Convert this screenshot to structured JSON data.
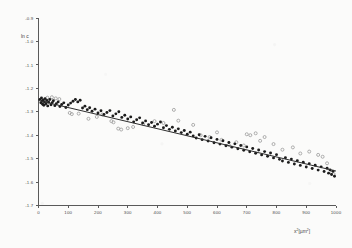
{
  "chart_data": {
    "type": "scatter",
    "title": "",
    "subtitle": "",
    "xlabel": "x² [µm²]",
    "xlabel_base": "x",
    "xlabel_sup": "2",
    "xlabel_unit": "[µm",
    "xlabel_unit_sup": "2",
    "xlabel_unit_close": "]",
    "ylabel": "ln c",
    "xlim": [
      0,
      1000
    ],
    "ylim": [
      -1.7,
      -0.9
    ],
    "grid": false,
    "legend": "none",
    "x_ticks": [
      0,
      100,
      200,
      300,
      400,
      500,
      600,
      700,
      800,
      900,
      1000
    ],
    "x_tick_labels": [
      "0",
      "100",
      "200",
      "300",
      "400",
      "500",
      "600",
      "700",
      "800",
      "900",
      "1000"
    ],
    "y_ticks": [
      -0.9,
      -1.0,
      -1.1,
      -1.2,
      -1.3,
      -1.4,
      -1.5,
      -1.6,
      -1.7
    ],
    "y_tick_labels": [
      "-0.9",
      "-1.0",
      "-1.1",
      "-1.2",
      "-1.3",
      "-1.4",
      "-1.5",
      "-1.6",
      "-1.7"
    ],
    "fit_line": {
      "name": "linear regression fit",
      "x_start": 0,
      "y_start": -1.252,
      "x_end": 1000,
      "y_end": -1.553,
      "slope": -0.000301,
      "intercept": -1.252
    },
    "series": [
      {
        "name": "filled markers",
        "marker": "filled-circle",
        "color": "#1c1c1c",
        "points": [
          [
            5,
            -1.247
          ],
          [
            8,
            -1.262
          ],
          [
            10,
            -1.241
          ],
          [
            12,
            -1.255
          ],
          [
            14,
            -1.268
          ],
          [
            16,
            -1.25
          ],
          [
            18,
            -1.272
          ],
          [
            20,
            -1.258
          ],
          [
            22,
            -1.244
          ],
          [
            25,
            -1.266
          ],
          [
            28,
            -1.252
          ],
          [
            31,
            -1.275
          ],
          [
            34,
            -1.259
          ],
          [
            38,
            -1.248
          ],
          [
            42,
            -1.27
          ],
          [
            46,
            -1.261
          ],
          [
            50,
            -1.253
          ],
          [
            55,
            -1.274
          ],
          [
            60,
            -1.266
          ],
          [
            66,
            -1.258
          ],
          [
            72,
            -1.278
          ],
          [
            78,
            -1.269
          ],
          [
            85,
            -1.262
          ],
          [
            92,
            -1.282
          ],
          [
            100,
            -1.271
          ],
          [
            108,
            -1.263
          ],
          [
            116,
            -1.255
          ],
          [
            124,
            -1.248
          ],
          [
            132,
            -1.258
          ],
          [
            140,
            -1.251
          ],
          [
            148,
            -1.284
          ],
          [
            156,
            -1.276
          ],
          [
            164,
            -1.291
          ],
          [
            172,
            -1.283
          ],
          [
            180,
            -1.298
          ],
          [
            190,
            -1.289
          ],
          [
            200,
            -1.305
          ],
          [
            210,
            -1.296
          ],
          [
            220,
            -1.312
          ],
          [
            230,
            -1.303
          ],
          [
            240,
            -1.295
          ],
          [
            250,
            -1.318
          ],
          [
            260,
            -1.309
          ],
          [
            270,
            -1.3
          ],
          [
            280,
            -1.324
          ],
          [
            290,
            -1.315
          ],
          [
            300,
            -1.331
          ],
          [
            310,
            -1.322
          ],
          [
            320,
            -1.343
          ],
          [
            330,
            -1.334
          ],
          [
            340,
            -1.326
          ],
          [
            350,
            -1.348
          ],
          [
            360,
            -1.339
          ],
          [
            370,
            -1.355
          ],
          [
            380,
            -1.346
          ],
          [
            390,
            -1.362
          ],
          [
            400,
            -1.353
          ],
          [
            410,
            -1.344
          ],
          [
            420,
            -1.368
          ],
          [
            430,
            -1.359
          ],
          [
            440,
            -1.375
          ],
          [
            450,
            -1.366
          ],
          [
            460,
            -1.382
          ],
          [
            470,
            -1.373
          ],
          [
            480,
            -1.389
          ],
          [
            490,
            -1.38
          ],
          [
            500,
            -1.396
          ],
          [
            510,
            -1.387
          ],
          [
            520,
            -1.403
          ],
          [
            530,
            -1.412
          ],
          [
            540,
            -1.398
          ],
          [
            550,
            -1.419
          ],
          [
            560,
            -1.405
          ],
          [
            570,
            -1.425
          ],
          [
            580,
            -1.411
          ],
          [
            590,
            -1.432
          ],
          [
            600,
            -1.418
          ],
          [
            610,
            -1.438
          ],
          [
            620,
            -1.424
          ],
          [
            630,
            -1.445
          ],
          [
            640,
            -1.431
          ],
          [
            650,
            -1.451
          ],
          [
            660,
            -1.437
          ],
          [
            670,
            -1.458
          ],
          [
            680,
            -1.444
          ],
          [
            690,
            -1.464
          ],
          [
            700,
            -1.45
          ],
          [
            710,
            -1.471
          ],
          [
            720,
            -1.457
          ],
          [
            730,
            -1.477
          ],
          [
            740,
            -1.463
          ],
          [
            750,
            -1.484
          ],
          [
            760,
            -1.47
          ],
          [
            770,
            -1.49
          ],
          [
            780,
            -1.476
          ],
          [
            790,
            -1.497
          ],
          [
            800,
            -1.483
          ],
          [
            810,
            -1.503
          ],
          [
            820,
            -1.51
          ],
          [
            830,
            -1.496
          ],
          [
            840,
            -1.516
          ],
          [
            850,
            -1.502
          ],
          [
            860,
            -1.523
          ],
          [
            870,
            -1.509
          ],
          [
            880,
            -1.529
          ],
          [
            890,
            -1.515
          ],
          [
            900,
            -1.536
          ],
          [
            910,
            -1.522
          ],
          [
            920,
            -1.542
          ],
          [
            930,
            -1.528
          ],
          [
            940,
            -1.549
          ],
          [
            950,
            -1.535
          ],
          [
            960,
            -1.555
          ],
          [
            970,
            -1.541
          ],
          [
            975,
            -1.562
          ],
          [
            980,
            -1.548
          ],
          [
            985,
            -1.568
          ],
          [
            990,
            -1.554
          ],
          [
            995,
            -1.575
          ]
        ]
      },
      {
        "name": "open markers",
        "marker": "open-circle",
        "color": "#9a9a9a",
        "points": [
          [
            30,
            -1.24
          ],
          [
            45,
            -1.238
          ],
          [
            58,
            -1.243
          ],
          [
            70,
            -1.246
          ],
          [
            105,
            -1.305
          ],
          [
            112,
            -1.31
          ],
          [
            135,
            -1.308
          ],
          [
            168,
            -1.33
          ],
          [
            196,
            -1.322
          ],
          [
            215,
            -1.312
          ],
          [
            245,
            -1.34
          ],
          [
            252,
            -1.345
          ],
          [
            268,
            -1.372
          ],
          [
            278,
            -1.376
          ],
          [
            300,
            -1.37
          ],
          [
            318,
            -1.365
          ],
          [
            352,
            -1.352
          ],
          [
            390,
            -1.34
          ],
          [
            420,
            -1.348
          ],
          [
            455,
            -1.292
          ],
          [
            470,
            -1.338
          ],
          [
            520,
            -1.356
          ],
          [
            545,
            -1.4
          ],
          [
            575,
            -1.408
          ],
          [
            600,
            -1.388
          ],
          [
            615,
            -1.42
          ],
          [
            640,
            -1.442
          ],
          [
            665,
            -1.43
          ],
          [
            690,
            -1.444
          ],
          [
            700,
            -1.396
          ],
          [
            712,
            -1.4
          ],
          [
            730,
            -1.392
          ],
          [
            745,
            -1.424
          ],
          [
            760,
            -1.408
          ],
          [
            790,
            -1.438
          ],
          [
            820,
            -1.462
          ],
          [
            855,
            -1.452
          ],
          [
            880,
            -1.478
          ],
          [
            910,
            -1.47
          ],
          [
            940,
            -1.484
          ],
          [
            955,
            -1.492
          ],
          [
            970,
            -1.52
          ],
          [
            985,
            -1.56
          ],
          [
            992,
            -1.566
          ]
        ]
      }
    ]
  }
}
